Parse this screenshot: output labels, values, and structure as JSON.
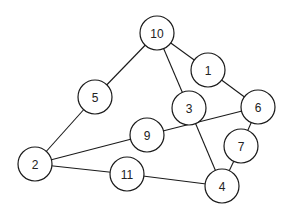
{
  "graph": {
    "type": "undirected",
    "node_radius": 17,
    "colors": {
      "stroke": "#1a1a1a",
      "fill": "#ffffff",
      "text": "#222222"
    },
    "nodes": [
      {
        "id": "1",
        "label": "1",
        "x": 208,
        "y": 70
      },
      {
        "id": "2",
        "label": "2",
        "x": 35,
        "y": 164
      },
      {
        "id": "3",
        "label": "3",
        "x": 189,
        "y": 108
      },
      {
        "id": "4",
        "label": "4",
        "x": 222,
        "y": 186
      },
      {
        "id": "5",
        "label": "5",
        "x": 95,
        "y": 97
      },
      {
        "id": "6",
        "label": "6",
        "x": 258,
        "y": 107
      },
      {
        "id": "7",
        "label": "7",
        "x": 241,
        "y": 146
      },
      {
        "id": "9",
        "label": "9",
        "x": 147,
        "y": 135
      },
      {
        "id": "10",
        "label": "10",
        "x": 157,
        "y": 33
      },
      {
        "id": "11",
        "label": "11",
        "x": 127,
        "y": 174
      }
    ],
    "edges": [
      [
        "10",
        "1"
      ],
      [
        "10",
        "5"
      ],
      [
        "10",
        "3"
      ],
      [
        "1",
        "6"
      ],
      [
        "5",
        "2"
      ],
      [
        "2",
        "9"
      ],
      [
        "2",
        "11"
      ],
      [
        "9",
        "6"
      ],
      [
        "3",
        "4"
      ],
      [
        "6",
        "7"
      ],
      [
        "7",
        "4"
      ],
      [
        "11",
        "4"
      ]
    ]
  }
}
